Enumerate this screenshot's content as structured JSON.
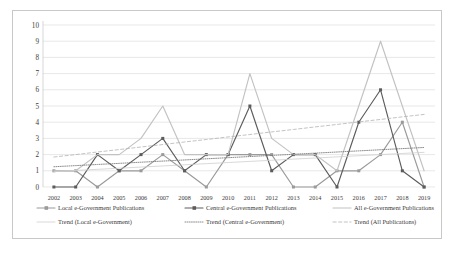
{
  "chart_data": {
    "type": "line",
    "title": "",
    "subtitle": "",
    "xlabel": "",
    "ylabel": "",
    "ylim": [
      0,
      10
    ],
    "yticks": [
      0,
      1,
      2,
      3,
      4,
      5,
      6,
      7,
      8,
      9,
      10
    ],
    "grid": true,
    "legend_position": "bottom",
    "categories": [
      "2002",
      "2003",
      "2004",
      "2005",
      "2006",
      "2007",
      "2008",
      "2009",
      "2010",
      "2011",
      "2012",
      "2013",
      "2014",
      "2015",
      "2016",
      "2017",
      "2018",
      "2019"
    ],
    "series": [
      {
        "name": "Local e-Government Publications",
        "key": "local",
        "color": "#9a9a9a",
        "style": "solid",
        "marker": "square",
        "values": [
          1,
          1,
          0,
          1,
          1,
          2,
          1,
          0,
          2,
          2,
          2,
          0,
          0,
          1,
          1,
          2,
          4,
          0
        ]
      },
      {
        "name": "Central e-Government Publications",
        "key": "central",
        "color": "#5c5c5c",
        "style": "solid",
        "marker": "square",
        "values": [
          0,
          0,
          2,
          1,
          2,
          3,
          1,
          2,
          2,
          5,
          1,
          2,
          2,
          0,
          4,
          6,
          1,
          0
        ]
      },
      {
        "name": "All e-Government Publications",
        "key": "all",
        "color": "#c2c2c2",
        "style": "solid",
        "marker": "none",
        "values": [
          1,
          1,
          2,
          2,
          3,
          5,
          2,
          2,
          2,
          7,
          3,
          2,
          2,
          1,
          5,
          9,
          5,
          1
        ]
      },
      {
        "name": "Trend (Local e-Government)",
        "key": "trend_local",
        "color": "#cfcfcf",
        "style": "solid-thin",
        "marker": "none",
        "values": [
          0.95,
          1.02,
          1.09,
          1.16,
          1.23,
          1.3,
          1.37,
          1.44,
          1.51,
          1.58,
          1.65,
          1.72,
          1.79,
          1.86,
          1.93,
          2.0,
          2.07,
          2.14
        ]
      },
      {
        "name": "Trend (Central e-Government)",
        "key": "trend_central",
        "color": "#6e6e6e",
        "style": "dotted",
        "marker": "none",
        "values": [
          1.25,
          1.32,
          1.39,
          1.46,
          1.53,
          1.6,
          1.67,
          1.74,
          1.81,
          1.88,
          1.95,
          2.02,
          2.09,
          2.16,
          2.23,
          2.3,
          2.37,
          2.44
        ]
      },
      {
        "name": "Trend (All Publications)",
        "key": "trend_all",
        "color": "#b4b4b4",
        "style": "dashed",
        "marker": "none",
        "values": [
          1.85,
          2.0,
          2.16,
          2.31,
          2.47,
          2.62,
          2.78,
          2.93,
          3.09,
          3.24,
          3.4,
          3.55,
          3.71,
          3.86,
          4.02,
          4.17,
          4.33,
          4.48
        ]
      }
    ],
    "legend": [
      {
        "label": "Local e-Government Publications",
        "key": "local"
      },
      {
        "label": "Central e-Government Publications",
        "key": "central"
      },
      {
        "label": "All e-Government Publications",
        "key": "all"
      },
      {
        "label": "Trend (Local e-Government)",
        "key": "trend_local"
      },
      {
        "label": "Trend (Central e-Government)",
        "key": "trend_central"
      },
      {
        "label": "Trend (All Publications)",
        "key": "trend_all"
      }
    ]
  }
}
